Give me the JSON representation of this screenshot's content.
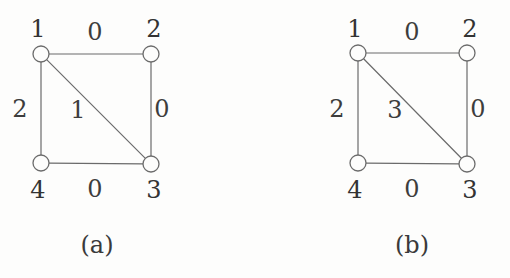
{
  "figure": {
    "background_color": "#fdfdfc",
    "stroke_color": "#6b6b6b",
    "text_color": "#3b3b3b",
    "panels": [
      {
        "id": "a",
        "caption": "(a)",
        "nodes": [
          {
            "id": "n1",
            "label": "1",
            "cx": 41,
            "cy": 54,
            "r": 8,
            "label_x": 38,
            "label_y": 29
          },
          {
            "id": "n2",
            "label": "2",
            "cx": 151,
            "cy": 54,
            "r": 8,
            "label_x": 154,
            "label_y": 29
          },
          {
            "id": "n3",
            "label": "3",
            "cx": 151,
            "cy": 164,
            "r": 8,
            "label_x": 154,
            "label_y": 190
          },
          {
            "id": "n4",
            "label": "4",
            "cx": 41,
            "cy": 163,
            "r": 8,
            "label_x": 38,
            "label_y": 190
          }
        ],
        "edges": [
          {
            "id": "e12",
            "from": "n1",
            "to": "n2",
            "weight": "0",
            "label_x": 95,
            "label_y": 32
          },
          {
            "id": "e23",
            "from": "n2",
            "to": "n3",
            "weight": "0",
            "label_x": 162,
            "label_y": 109
          },
          {
            "id": "e34",
            "from": "n3",
            "to": "n4",
            "weight": "0",
            "label_x": 95,
            "label_y": 189
          },
          {
            "id": "e14",
            "from": "n1",
            "to": "n4",
            "weight": "2",
            "label_x": 20,
            "label_y": 109
          },
          {
            "id": "e13",
            "from": "n1",
            "to": "n3",
            "weight": "1",
            "label_x": 78,
            "label_y": 110
          }
        ]
      },
      {
        "id": "b",
        "caption": "(b)",
        "nodes": [
          {
            "id": "n1",
            "label": "1",
            "cx": 103,
            "cy": 53,
            "r": 8,
            "label_x": 100,
            "label_y": 29
          },
          {
            "id": "n2",
            "label": "2",
            "cx": 212,
            "cy": 53,
            "r": 8,
            "label_x": 215,
            "label_y": 29
          },
          {
            "id": "n3",
            "label": "3",
            "cx": 212,
            "cy": 164,
            "r": 8,
            "label_x": 215,
            "label_y": 190
          },
          {
            "id": "n4",
            "label": "4",
            "cx": 103,
            "cy": 163,
            "r": 8,
            "label_x": 100,
            "label_y": 190
          }
        ],
        "edges": [
          {
            "id": "e12",
            "from": "n1",
            "to": "n2",
            "weight": "0",
            "label_x": 157,
            "label_y": 32
          },
          {
            "id": "e23",
            "from": "n2",
            "to": "n3",
            "weight": "0",
            "label_x": 223,
            "label_y": 109
          },
          {
            "id": "e34",
            "from": "n3",
            "to": "n4",
            "weight": "0",
            "label_x": 157,
            "label_y": 189
          },
          {
            "id": "e14",
            "from": "n1",
            "to": "n4",
            "weight": "2",
            "label_x": 82,
            "label_y": 109
          },
          {
            "id": "e13",
            "from": "n1",
            "to": "n3",
            "weight": "3",
            "label_x": 140,
            "label_y": 110
          }
        ]
      }
    ],
    "caption_positions": [
      {
        "panel": "a",
        "x": 97,
        "y": 245
      },
      {
        "panel": "b",
        "x": 157,
        "y": 245
      }
    ]
  }
}
